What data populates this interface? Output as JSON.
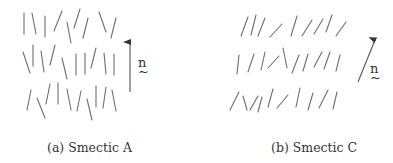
{
  "figure": {
    "panels": [
      {
        "id": "a",
        "caption": "(a)  Smectic A",
        "director_label": "n",
        "director_tilde": "~",
        "layers": 3,
        "molecules": [
          [
            24,
            13,
            24,
            34
          ],
          [
            32,
            13,
            36,
            34
          ],
          [
            45,
            16,
            45,
            37
          ],
          [
            62,
            11,
            54,
            31
          ],
          [
            67,
            22,
            71,
            43
          ],
          [
            80,
            9,
            74,
            28
          ],
          [
            88,
            18,
            83,
            38
          ],
          [
            99,
            12,
            106,
            32
          ],
          [
            116,
            18,
            111,
            38
          ],
          [
            23,
            52,
            30,
            73
          ],
          [
            33,
            45,
            33,
            66
          ],
          [
            41,
            51,
            44,
            72
          ],
          [
            55,
            45,
            50,
            65
          ],
          [
            62,
            58,
            67,
            79
          ],
          [
            76,
            54,
            76,
            75
          ],
          [
            85,
            53,
            85,
            74
          ],
          [
            96,
            48,
            91,
            68
          ],
          [
            104,
            53,
            106,
            74
          ],
          [
            114,
            54,
            114,
            75
          ],
          [
            31,
            90,
            27,
            110
          ],
          [
            37,
            98,
            45,
            118
          ],
          [
            50,
            84,
            46,
            104
          ],
          [
            58,
            83,
            58,
            104
          ],
          [
            67,
            89,
            71,
            110
          ],
          [
            81,
            91,
            77,
            111
          ],
          [
            87,
            99,
            92,
            120
          ],
          [
            96,
            86,
            96,
            107
          ],
          [
            106,
            87,
            103,
            108
          ],
          [
            112,
            90,
            116,
            111
          ]
        ],
        "arrow": {
          "x1": 130,
          "y1": 92,
          "x2": 130,
          "y2": 42
        },
        "label_pos": {
          "x": 138,
          "y": 67
        }
      },
      {
        "id": "b",
        "caption": "(b)  Smectic C",
        "director_label": "n",
        "director_tilde": "~",
        "layers": 3,
        "molecules": [
          [
            241,
            36,
            248,
            17
          ],
          [
            251,
            35,
            256,
            15
          ],
          [
            258,
            36,
            265,
            18
          ],
          [
            270,
            37,
            282,
            24
          ],
          [
            291,
            36,
            297,
            16
          ],
          [
            302,
            36,
            312,
            20
          ],
          [
            314,
            34,
            323,
            19
          ],
          [
            326,
            32,
            332,
            15
          ],
          [
            336,
            36,
            346,
            22
          ],
          [
            237,
            74,
            239,
            55
          ],
          [
            248,
            72,
            254,
            54
          ],
          [
            261,
            70,
            265,
            52
          ],
          [
            268,
            68,
            279,
            56
          ],
          [
            287,
            68,
            283,
            48
          ],
          [
            292,
            73,
            299,
            55
          ],
          [
            303,
            71,
            308,
            54
          ],
          [
            314,
            67,
            322,
            52
          ],
          [
            324,
            69,
            330,
            52
          ],
          [
            336,
            71,
            340,
            55
          ]
        ],
        "molecules_row3": [
          [
            230,
            110,
            239,
            92
          ],
          [
            243,
            96,
            247,
            110
          ],
          [
            250,
            110,
            258,
            96
          ],
          [
            258,
            112,
            262,
            97
          ],
          [
            268,
            107,
            273,
            89
          ],
          [
            277,
            108,
            288,
            95
          ],
          [
            296,
            107,
            300,
            88
          ],
          [
            308,
            110,
            313,
            93
          ],
          [
            319,
            108,
            328,
            90
          ],
          [
            333,
            109,
            337,
            92
          ]
        ],
        "arrow": {
          "x1": 358,
          "y1": 82,
          "x2": 375,
          "y2": 40
        },
        "label_pos": {
          "x": 370,
          "y": 73
        }
      }
    ]
  }
}
